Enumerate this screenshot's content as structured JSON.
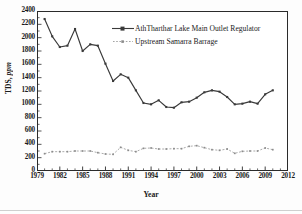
{
  "figure": {
    "title": "",
    "axis_title_y_main": "TDS,",
    "axis_title_y_italic": "ppm",
    "axis_title_x": "Year"
  },
  "legend": {
    "entries": [
      {
        "label": "AthTharthar Lake Main Outlet Regulator",
        "marker": "filled-square",
        "style": "solid-dark",
        "color": "#3a3a3a"
      },
      {
        "label": "Upstream Samarra Barrage",
        "marker": "small-square",
        "style": "dotted-light",
        "color": "#8c8c8c"
      }
    ]
  },
  "axes": {
    "y_ticks": [
      0,
      200,
      400,
      600,
      800,
      1000,
      1200,
      1400,
      1600,
      1800,
      2000,
      2200,
      2400
    ],
    "y_tick_labels": [
      "0",
      "200",
      "400",
      "600",
      "800",
      "1000",
      "1200",
      "1400",
      "1600",
      "1800",
      "2000",
      "2200",
      "2400"
    ],
    "x_tick_labels": [
      "1979",
      "1982",
      "1985",
      "1988",
      "1991",
      "1994",
      "1997",
      "2000",
      "2003",
      "2006",
      "2009",
      "2012"
    ]
  },
  "chart_data": {
    "type": "line",
    "title": "",
    "xlabel": "Year",
    "ylabel": "TDS, ppm",
    "xlim": [
      1979,
      2012
    ],
    "ylim": [
      0,
      2400
    ],
    "ytick_step": 200,
    "xtick_step": 3,
    "xtick_minor_step": 1,
    "grid": false,
    "legend_position": "upper-center",
    "x": [
      1980,
      1981,
      1982,
      1983,
      1984,
      1985,
      1986,
      1987,
      1988,
      1989,
      1990,
      1991,
      1992,
      1993,
      1994,
      1995,
      1996,
      1997,
      1998,
      1999,
      2000,
      2001,
      2002,
      2003,
      2004,
      2005,
      2006,
      2007,
      2008,
      2009,
      2010
    ],
    "series": [
      {
        "name": "AthTharthar Lake Main Outlet Regulator",
        "color": "#3a3a3a",
        "values": [
          2280,
          2020,
          1860,
          1880,
          2130,
          1800,
          1900,
          1880,
          1610,
          1350,
          1450,
          1400,
          1210,
          1020,
          1000,
          1060,
          960,
          950,
          1030,
          1040,
          1100,
          1180,
          1210,
          1190,
          1110,
          1000,
          1010,
          1040,
          1010,
          1150,
          1210
        ]
      },
      {
        "name": "Upstream Samarra Barrage",
        "color": "#8c8c8c",
        "values": [
          260,
          290,
          290,
          290,
          300,
          300,
          300,
          275,
          255,
          250,
          355,
          310,
          290,
          340,
          345,
          330,
          330,
          335,
          335,
          370,
          380,
          350,
          320,
          310,
          330,
          265,
          295,
          300,
          300,
          345,
          320
        ]
      }
    ]
  }
}
